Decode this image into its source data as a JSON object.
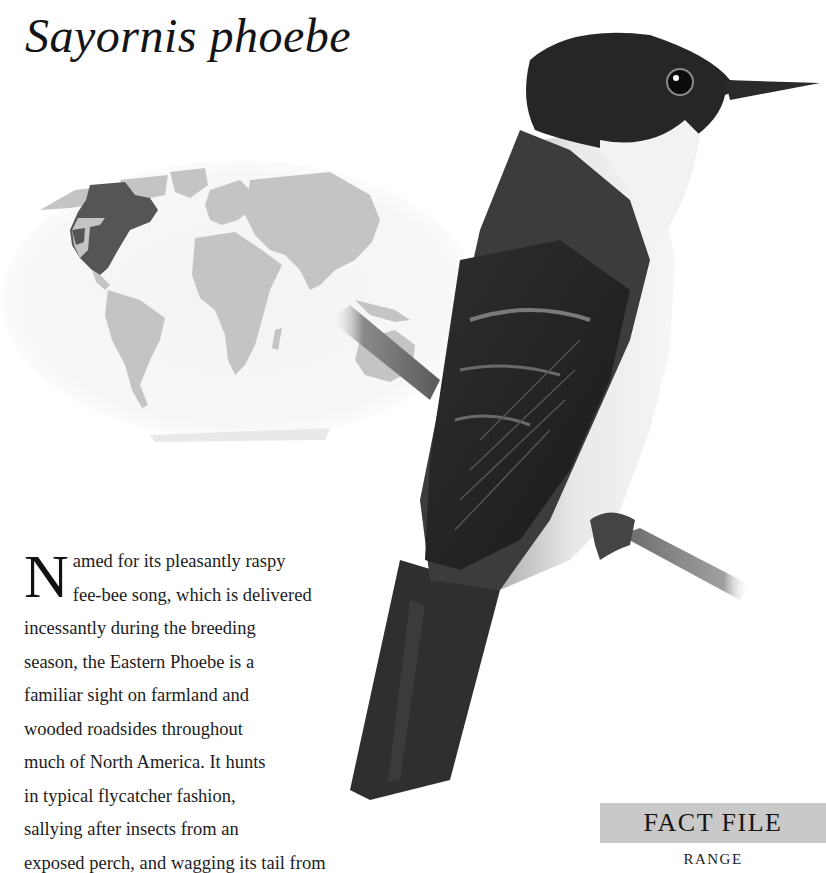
{
  "page": {
    "title": "Sayornis phoebe"
  },
  "map": {
    "label": "world-range-map",
    "colors": {
      "land": "#c4c4c4",
      "range": "#555555",
      "ocean": "#f4f4f4"
    },
    "range_region": "North America (eastern and central USA, Canada, Mexico)"
  },
  "illustration": {
    "subject": "Eastern Phoebe perched on a branch"
  },
  "body": {
    "drop_cap": "N",
    "lines": [
      "amed for its pleasantly raspy",
      "fee-bee song, which is delivered",
      "incessantly during the breeding",
      "season, the Eastern Phoebe is a",
      "familiar sight on farmland and",
      "wooded roadsides throughout",
      "much of North America. It hunts",
      "in typical flycatcher fashion,",
      "sallying after insects from an",
      "exposed perch, and wagging its tail from"
    ]
  },
  "fact_file": {
    "header": "FACT FILE",
    "section": "RANGE",
    "header_bg": "#c9c9c9"
  }
}
